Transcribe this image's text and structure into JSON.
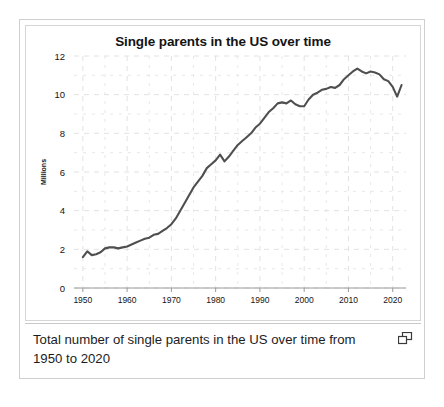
{
  "figure": {
    "caption": "Total number of single parents in the US over time from 1950 to 2020",
    "expand_icon_name": "expand-window-icon"
  },
  "colors": {
    "line": "#4f4f4f",
    "grid": "#e2e2e2",
    "axis": "#9a9a9a",
    "text": "#141414",
    "card_border": "#cfcfcf",
    "panel_border": "#d6d6d6"
  },
  "chart_data": {
    "type": "line",
    "title": "Single parents in the US over time",
    "xlabel": "",
    "ylabel": "Millions",
    "xlim": [
      1948,
      2023
    ],
    "ylim": [
      0,
      12
    ],
    "xticks": [
      1950,
      1960,
      1970,
      1980,
      1990,
      2000,
      2010,
      2020
    ],
    "yticks": [
      0,
      2,
      4,
      6,
      8,
      10,
      12
    ],
    "xtick_labels": [
      "1950",
      "1960",
      "1970",
      "1980",
      "1990",
      "2000",
      "2010",
      "2020"
    ],
    "ytick_labels": [
      "0",
      "2",
      "4",
      "6",
      "8",
      "10",
      "12"
    ],
    "grid": true,
    "grid_style": "dashed",
    "minor_grid": true,
    "legend": false,
    "series": [
      {
        "name": "Single parents (millions)",
        "x": [
          1950,
          1951,
          1952,
          1953,
          1954,
          1955,
          1956,
          1957,
          1958,
          1959,
          1960,
          1961,
          1962,
          1963,
          1964,
          1965,
          1966,
          1967,
          1968,
          1969,
          1970,
          1971,
          1972,
          1973,
          1974,
          1975,
          1976,
          1977,
          1978,
          1979,
          1980,
          1981,
          1982,
          1983,
          1984,
          1985,
          1986,
          1987,
          1988,
          1989,
          1990,
          1991,
          1992,
          1993,
          1994,
          1995,
          1996,
          1997,
          1998,
          1999,
          2000,
          2001,
          2002,
          2003,
          2004,
          2005,
          2006,
          2007,
          2008,
          2009,
          2010,
          2011,
          2012,
          2013,
          2014,
          2015,
          2016,
          2017,
          2018,
          2019,
          2020,
          2021,
          2022
        ],
        "y": [
          1.6,
          1.9,
          1.7,
          1.75,
          1.85,
          2.05,
          2.1,
          2.1,
          2.05,
          2.1,
          2.15,
          2.25,
          2.35,
          2.45,
          2.55,
          2.6,
          2.75,
          2.8,
          2.95,
          3.1,
          3.3,
          3.6,
          4.0,
          4.4,
          4.8,
          5.2,
          5.5,
          5.8,
          6.2,
          6.4,
          6.6,
          6.9,
          6.55,
          6.8,
          7.1,
          7.4,
          7.6,
          7.8,
          8.0,
          8.3,
          8.5,
          8.8,
          9.1,
          9.3,
          9.55,
          9.6,
          9.55,
          9.7,
          9.5,
          9.4,
          9.4,
          9.75,
          10.0,
          10.1,
          10.25,
          10.3,
          10.4,
          10.35,
          10.5,
          10.8,
          11.0,
          11.2,
          11.35,
          11.2,
          11.1,
          11.2,
          11.15,
          11.05,
          10.8,
          10.7,
          10.4,
          9.9,
          10.5
        ]
      }
    ]
  }
}
